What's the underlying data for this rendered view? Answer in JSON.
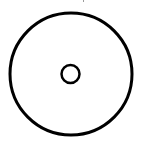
{
  "diagram": {
    "type": "concentric-circles",
    "stroke_color": "#000000",
    "background": "#ffffff",
    "outer_circle": {
      "cx": 71,
      "cy": 74,
      "r": 61,
      "stroke_width": 3
    },
    "inner_circle": {
      "cx": 70.5,
      "cy": 74,
      "r": 9,
      "stroke_width": 2.5
    }
  }
}
